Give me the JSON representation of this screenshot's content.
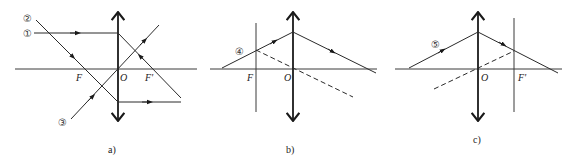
{
  "figure": {
    "panels": [
      {
        "id": "a",
        "caption": "a)",
        "labels": {
          "F": "F",
          "O": "O",
          "F_prime": "F'"
        },
        "rays": [
          {
            "label": "①",
            "description": "parallel to axis, refracts through F'"
          },
          {
            "label": "②",
            "description": "passes through F, exits parallel to axis"
          },
          {
            "label": "③",
            "description": "passes through optical center O, undeviated"
          }
        ]
      },
      {
        "id": "b",
        "caption": "b)",
        "labels": {
          "F": "F",
          "O": "O"
        },
        "rays": [
          {
            "label": "④",
            "description": "oblique ray; auxiliary dashed ray through O parallel, meeting at focal plane through F"
          }
        ]
      },
      {
        "id": "c",
        "caption": "c)",
        "labels": {
          "O": "O",
          "F_prime": "F'"
        },
        "rays": [
          {
            "label": "⑤",
            "description": "oblique ray; auxiliary dashed ray through O meets refracted ray at focal plane through F'"
          }
        ]
      }
    ]
  }
}
